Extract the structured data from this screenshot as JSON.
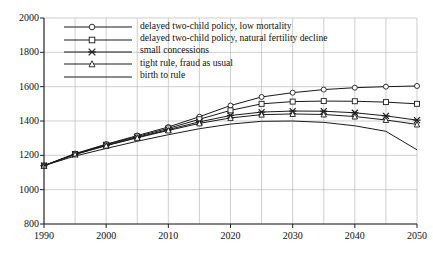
{
  "chart_data": {
    "type": "line",
    "title": "",
    "xlabel": "",
    "ylabel": "",
    "xlim": [
      1990,
      2050
    ],
    "ylim": [
      800,
      2000
    ],
    "xticks": [
      1990,
      2000,
      2010,
      2020,
      2030,
      2040,
      2050
    ],
    "yticks": [
      800,
      1000,
      1200,
      1400,
      1600,
      1800,
      2000
    ],
    "xminor_step": 5,
    "grid": true,
    "legend_position": "upper-left-inside",
    "x": [
      1990,
      1995,
      2000,
      2005,
      2010,
      2015,
      2020,
      2025,
      2030,
      2035,
      2040,
      2045,
      2050
    ],
    "series": [
      {
        "name": "delayed two-child policy, low mortality",
        "marker": "circle",
        "values": [
          1140,
          1210,
          1265,
          1315,
          1365,
          1425,
          1490,
          1540,
          1565,
          1583,
          1594,
          1600,
          1604
        ]
      },
      {
        "name": "delayed two-child policy, natural fertility decline",
        "marker": "square",
        "values": [
          1140,
          1208,
          1262,
          1310,
          1357,
          1410,
          1462,
          1500,
          1513,
          1516,
          1515,
          1510,
          1500
        ]
      },
      {
        "name": "small concessions",
        "marker": "cross",
        "values": [
          1140,
          1206,
          1258,
          1305,
          1350,
          1395,
          1432,
          1452,
          1458,
          1457,
          1448,
          1430,
          1405
        ]
      },
      {
        "name": "tight rule, fraud as usual",
        "marker": "triangle",
        "values": [
          1140,
          1205,
          1256,
          1302,
          1345,
          1386,
          1418,
          1437,
          1441,
          1438,
          1426,
          1406,
          1380
        ]
      },
      {
        "name": "birth to rule",
        "marker": "none",
        "values": [
          1140,
          1196,
          1240,
          1282,
          1320,
          1355,
          1382,
          1398,
          1400,
          1392,
          1372,
          1340,
          1232
        ]
      }
    ]
  },
  "axis": {
    "y_labels": [
      "2000",
      "1800",
      "1600",
      "1400",
      "1200",
      "1000",
      "800"
    ],
    "x_labels": [
      "1990",
      "2000",
      "2010",
      "2020",
      "2030",
      "2040",
      "2050"
    ]
  }
}
